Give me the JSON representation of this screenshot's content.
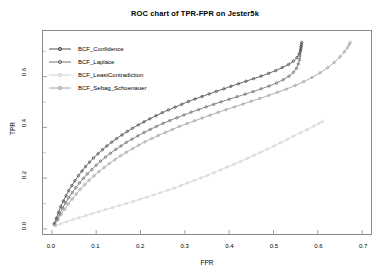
{
  "chart_data": {
    "type": "line",
    "title": "ROC chart of TPR-FPR on Jester5k",
    "xlabel": "FPR",
    "ylabel": "TPR",
    "xlim": [
      -0.02,
      0.72
    ],
    "ylim": [
      -0.02,
      0.78
    ],
    "xticks": [
      "0.0",
      "0.1",
      "0.2",
      "0.3",
      "0.4",
      "0.5",
      "0.6",
      "0.7"
    ],
    "xtick_values": [
      0.0,
      0.1,
      0.2,
      0.3,
      0.4,
      0.5,
      0.6,
      0.7
    ],
    "yticks": [
      "0.0",
      "0.2",
      "0.4",
      "0.6"
    ],
    "ytick_values": [
      0.0,
      0.2,
      0.4,
      0.6
    ],
    "grid": false,
    "legend_position": "upper-left-inside",
    "marker": "point-markers-on-line",
    "series": [
      {
        "name": "BCF_Confidence",
        "color": "#2b2b2b",
        "points": [
          [
            0.005,
            0.02
          ],
          [
            0.01,
            0.042
          ],
          [
            0.015,
            0.065
          ],
          [
            0.02,
            0.088
          ],
          [
            0.026,
            0.11
          ],
          [
            0.032,
            0.131
          ],
          [
            0.038,
            0.151
          ],
          [
            0.045,
            0.171
          ],
          [
            0.052,
            0.19
          ],
          [
            0.06,
            0.21
          ],
          [
            0.068,
            0.228
          ],
          [
            0.076,
            0.246
          ],
          [
            0.085,
            0.263
          ],
          [
            0.094,
            0.28
          ],
          [
            0.104,
            0.296
          ],
          [
            0.114,
            0.312
          ],
          [
            0.124,
            0.327
          ],
          [
            0.135,
            0.342
          ],
          [
            0.146,
            0.356
          ],
          [
            0.158,
            0.37
          ],
          [
            0.17,
            0.384
          ],
          [
            0.182,
            0.397
          ],
          [
            0.195,
            0.41
          ],
          [
            0.208,
            0.422
          ],
          [
            0.221,
            0.434
          ],
          [
            0.235,
            0.446
          ],
          [
            0.249,
            0.458
          ],
          [
            0.263,
            0.469
          ],
          [
            0.278,
            0.48
          ],
          [
            0.293,
            0.491
          ],
          [
            0.308,
            0.502
          ],
          [
            0.323,
            0.512
          ],
          [
            0.339,
            0.522
          ],
          [
            0.355,
            0.532
          ],
          [
            0.371,
            0.542
          ],
          [
            0.388,
            0.552
          ],
          [
            0.404,
            0.562
          ],
          [
            0.421,
            0.572
          ],
          [
            0.438,
            0.582
          ],
          [
            0.455,
            0.592
          ],
          [
            0.472,
            0.602
          ],
          [
            0.489,
            0.613
          ],
          [
            0.505,
            0.624
          ],
          [
            0.52,
            0.636
          ],
          [
            0.534,
            0.648
          ],
          [
            0.545,
            0.661
          ],
          [
            0.553,
            0.675
          ],
          [
            0.558,
            0.69
          ],
          [
            0.561,
            0.705
          ],
          [
            0.562,
            0.718
          ],
          [
            0.563,
            0.728
          ],
          [
            0.564,
            0.735
          ]
        ]
      },
      {
        "name": "BCF_Laplace",
        "color": "#555555",
        "points": [
          [
            0.006,
            0.018
          ],
          [
            0.012,
            0.039
          ],
          [
            0.018,
            0.06
          ],
          [
            0.024,
            0.082
          ],
          [
            0.031,
            0.103
          ],
          [
            0.038,
            0.123
          ],
          [
            0.046,
            0.143
          ],
          [
            0.054,
            0.162
          ],
          [
            0.062,
            0.181
          ],
          [
            0.071,
            0.199
          ],
          [
            0.08,
            0.217
          ],
          [
            0.09,
            0.234
          ],
          [
            0.1,
            0.251
          ],
          [
            0.11,
            0.267
          ],
          [
            0.121,
            0.283
          ],
          [
            0.132,
            0.298
          ],
          [
            0.144,
            0.313
          ],
          [
            0.156,
            0.327
          ],
          [
            0.168,
            0.341
          ],
          [
            0.181,
            0.354
          ],
          [
            0.194,
            0.367
          ],
          [
            0.208,
            0.38
          ],
          [
            0.222,
            0.392
          ],
          [
            0.236,
            0.404
          ],
          [
            0.251,
            0.416
          ],
          [
            0.266,
            0.427
          ],
          [
            0.282,
            0.438
          ],
          [
            0.298,
            0.449
          ],
          [
            0.314,
            0.46
          ],
          [
            0.331,
            0.47
          ],
          [
            0.348,
            0.481
          ],
          [
            0.365,
            0.491
          ],
          [
            0.382,
            0.501
          ],
          [
            0.4,
            0.511
          ],
          [
            0.418,
            0.521
          ],
          [
            0.436,
            0.531
          ],
          [
            0.454,
            0.541
          ],
          [
            0.472,
            0.552
          ],
          [
            0.49,
            0.563
          ],
          [
            0.507,
            0.575
          ],
          [
            0.522,
            0.588
          ],
          [
            0.535,
            0.602
          ],
          [
            0.545,
            0.617
          ],
          [
            0.552,
            0.633
          ],
          [
            0.556,
            0.65
          ],
          [
            0.559,
            0.667
          ],
          [
            0.56,
            0.683
          ],
          [
            0.561,
            0.698
          ],
          [
            0.562,
            0.71
          ],
          [
            0.563,
            0.72
          ]
        ]
      },
      {
        "name": "BCF_LeastContradiction",
        "color": "#c9c9c9",
        "points": [
          [
            0.008,
            0.012
          ],
          [
            0.02,
            0.02
          ],
          [
            0.033,
            0.028
          ],
          [
            0.047,
            0.036
          ],
          [
            0.061,
            0.044
          ],
          [
            0.076,
            0.052
          ],
          [
            0.091,
            0.06
          ],
          [
            0.106,
            0.068
          ],
          [
            0.121,
            0.076
          ],
          [
            0.137,
            0.084
          ],
          [
            0.152,
            0.092
          ],
          [
            0.168,
            0.1
          ],
          [
            0.183,
            0.108
          ],
          [
            0.199,
            0.117
          ],
          [
            0.214,
            0.125
          ],
          [
            0.23,
            0.134
          ],
          [
            0.245,
            0.143
          ],
          [
            0.261,
            0.152
          ],
          [
            0.276,
            0.161
          ],
          [
            0.291,
            0.171
          ],
          [
            0.306,
            0.181
          ],
          [
            0.321,
            0.191
          ],
          [
            0.336,
            0.201
          ],
          [
            0.351,
            0.211
          ],
          [
            0.366,
            0.222
          ],
          [
            0.381,
            0.233
          ],
          [
            0.396,
            0.244
          ],
          [
            0.411,
            0.255
          ],
          [
            0.426,
            0.266
          ],
          [
            0.441,
            0.278
          ],
          [
            0.456,
            0.29
          ],
          [
            0.471,
            0.302
          ],
          [
            0.486,
            0.314
          ],
          [
            0.501,
            0.327
          ],
          [
            0.516,
            0.34
          ],
          [
            0.531,
            0.353
          ],
          [
            0.546,
            0.366
          ],
          [
            0.561,
            0.379
          ],
          [
            0.576,
            0.392
          ],
          [
            0.591,
            0.405
          ],
          [
            0.602,
            0.415
          ],
          [
            0.61,
            0.423
          ]
        ]
      },
      {
        "name": "BCF_Sebag_Schoenauer",
        "color": "#8f8f8f",
        "points": [
          [
            0.007,
            0.016
          ],
          [
            0.014,
            0.036
          ],
          [
            0.021,
            0.057
          ],
          [
            0.029,
            0.078
          ],
          [
            0.037,
            0.098
          ],
          [
            0.046,
            0.118
          ],
          [
            0.055,
            0.137
          ],
          [
            0.064,
            0.156
          ],
          [
            0.074,
            0.174
          ],
          [
            0.084,
            0.192
          ],
          [
            0.095,
            0.209
          ],
          [
            0.106,
            0.226
          ],
          [
            0.118,
            0.242
          ],
          [
            0.13,
            0.258
          ],
          [
            0.142,
            0.273
          ],
          [
            0.155,
            0.288
          ],
          [
            0.168,
            0.302
          ],
          [
            0.182,
            0.316
          ],
          [
            0.196,
            0.33
          ],
          [
            0.21,
            0.343
          ],
          [
            0.225,
            0.356
          ],
          [
            0.24,
            0.368
          ],
          [
            0.256,
            0.38
          ],
          [
            0.272,
            0.392
          ],
          [
            0.288,
            0.404
          ],
          [
            0.305,
            0.415
          ],
          [
            0.322,
            0.426
          ],
          [
            0.339,
            0.437
          ],
          [
            0.357,
            0.448
          ],
          [
            0.375,
            0.459
          ],
          [
            0.393,
            0.47
          ],
          [
            0.412,
            0.481
          ],
          [
            0.431,
            0.492
          ],
          [
            0.45,
            0.503
          ],
          [
            0.469,
            0.514
          ],
          [
            0.489,
            0.526
          ],
          [
            0.509,
            0.538
          ],
          [
            0.529,
            0.551
          ],
          [
            0.549,
            0.565
          ],
          [
            0.568,
            0.58
          ],
          [
            0.587,
            0.597
          ],
          [
            0.605,
            0.615
          ],
          [
            0.622,
            0.635
          ],
          [
            0.637,
            0.656
          ],
          [
            0.65,
            0.678
          ],
          [
            0.66,
            0.698
          ],
          [
            0.667,
            0.715
          ],
          [
            0.671,
            0.727
          ],
          [
            0.673,
            0.735
          ]
        ]
      }
    ]
  },
  "legend": {
    "items": [
      {
        "label": "BCF_Confidence"
      },
      {
        "label": "BCF_Laplace"
      },
      {
        "label": "BCF_LeastContradiction"
      },
      {
        "label": "BCF_Sebag_Schoenauer"
      }
    ]
  }
}
